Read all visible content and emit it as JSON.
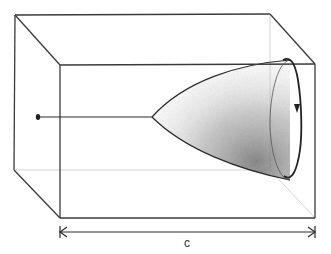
{
  "figure": {
    "dimension": {
      "label": "c",
      "type": "double-arrow"
    },
    "elements": {
      "box": "rectangular-prism",
      "surface": "paraboloid",
      "rotation_direction": "clockwise-downward",
      "point_marker": "dot"
    },
    "colors": {
      "line": "#3a3a3a",
      "hidden_line": "#c8c8c8",
      "shading": "#555555",
      "background": "#ffffff"
    }
  }
}
